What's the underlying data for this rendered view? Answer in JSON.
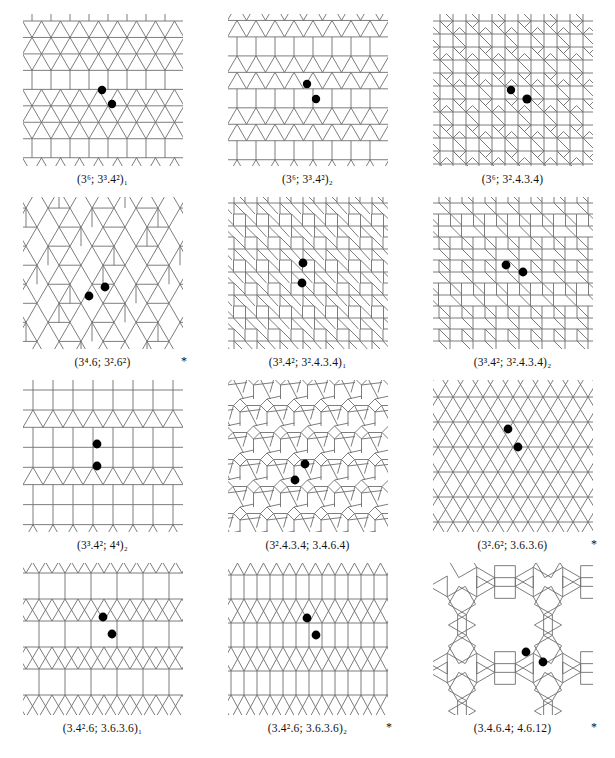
{
  "figure": {
    "kind": "two-uniform-tilings-plate",
    "columns": 3,
    "rows": 4,
    "edge_color": "#6e6e6e",
    "vertex_dot_color": "#000000",
    "background_color": "#ffffff",
    "marked_vertices_per_panel": 2,
    "star_symbol": "*"
  },
  "panels": [
    {
      "index": 1,
      "caption": "(3⁶; 3³.4²)₁",
      "caption_parts": {
        "first": "3",
        "first_sup": "6",
        "second": "3",
        "second_sup": "3",
        "third": "4",
        "third_sup": "2",
        "subscript": "1"
      },
      "starred": false,
      "star": "",
      "tiling_type": "triangle-square-bands",
      "vertex_types": [
        "3.3.3.3.3.3",
        "3.3.3.4.4"
      ]
    },
    {
      "index": 2,
      "caption": "(3⁶; 3³.4²)₂",
      "caption_parts": {
        "first": "3",
        "first_sup": "6",
        "second": "3",
        "second_sup": "3",
        "third": "4",
        "third_sup": "2",
        "subscript": "2"
      },
      "starred": false,
      "star": "",
      "tiling_type": "double-triangle-square-bands",
      "vertex_types": [
        "3.3.3.3.3.3",
        "3.3.3.4.4"
      ]
    },
    {
      "index": 3,
      "caption": "(3⁶; 3².4.3.4)",
      "caption_parts": {
        "first": "3",
        "first_sup": "6",
        "second": "3",
        "second_sup": "2",
        "third": "4.3.4",
        "third_sup": "",
        "subscript": ""
      },
      "starred": false,
      "star": "",
      "tiling_type": "triangle-square-rosette",
      "vertex_types": [
        "3.3.3.3.3.3",
        "3.3.4.3.4"
      ]
    },
    {
      "index": 4,
      "caption": "(3⁴.6; 3².6²)",
      "caption_parts": {
        "first": "3",
        "first_sup": "4",
        "first_tail": ".6",
        "second": "3",
        "second_sup": "2",
        "third": "6",
        "third_sup": "2",
        "subscript": ""
      },
      "starred": true,
      "star": "*",
      "tiling_type": "triangle-hexagon-lattice",
      "vertex_types": [
        "3.3.3.3.6",
        "3.3.6.6"
      ]
    },
    {
      "index": 5,
      "caption": "(3³.4²; 3².4.3.4)₁",
      "caption_parts": {
        "first": "3",
        "first_sup": "3",
        "first_tail": ".4",
        "first_sup2": "2",
        "second": "3",
        "second_sup": "2",
        "third": "4.3.4",
        "subscript": "1"
      },
      "starred": false,
      "star": "",
      "tiling_type": "square-triangle-mixed-a",
      "vertex_types": [
        "3.3.3.4.4",
        "3.3.4.3.4"
      ]
    },
    {
      "index": 6,
      "caption": "(3³.4²; 3².4.3.4)₂",
      "caption_parts": {
        "first": "3",
        "first_sup": "3",
        "first_tail": ".4",
        "first_sup2": "2",
        "second": "3",
        "second_sup": "2",
        "third": "4.3.4",
        "subscript": "2"
      },
      "starred": false,
      "star": "",
      "tiling_type": "square-triangle-mixed-b",
      "vertex_types": [
        "3.3.3.4.4",
        "3.3.4.3.4"
      ]
    },
    {
      "index": 7,
      "caption": "(3³.4²; 4⁴)₂",
      "caption_parts": {
        "first": "3",
        "first_sup": "3",
        "first_tail": ".4",
        "first_sup2": "2",
        "second": "4",
        "second_sup": "4",
        "subscript": "2"
      },
      "starred": false,
      "star": "",
      "tiling_type": "square-grid-triangle-bands",
      "vertex_types": [
        "3.3.3.4.4",
        "4.4.4.4"
      ]
    },
    {
      "index": 8,
      "caption": "(3².4.3.4; 3.4.6.4)",
      "caption_parts": {
        "first": "3",
        "first_sup": "2",
        "first_tail": ".4.3.4",
        "second": "3.4.6.4",
        "subscript": ""
      },
      "starred": false,
      "star": "",
      "tiling_type": "triangle-square-hexagon-mixed",
      "vertex_types": [
        "3.3.4.3.4",
        "3.4.6.4"
      ]
    },
    {
      "index": 9,
      "caption": "(3².6²; 3.6.3.6)",
      "caption_parts": {
        "first": "3",
        "first_sup": "2",
        "first_tail": ".6",
        "first_sup2": "2",
        "second": "3.6.3.6",
        "subscript": ""
      },
      "starred": true,
      "star": "*",
      "tiling_type": "hexagon-triangle-columns",
      "vertex_types": [
        "3.3.6.6",
        "3.6.3.6"
      ]
    },
    {
      "index": 10,
      "caption": "(3.4².6; 3.6.3.6)₁",
      "caption_parts": {
        "first": "3.4",
        "first_sup": "2",
        "first_tail": ".6",
        "second": "3.6.3.6",
        "subscript": "1"
      },
      "starred": false,
      "star": "",
      "tiling_type": "square-rows-x-rows-a",
      "vertex_types": [
        "3.4.4.6",
        "3.6.3.6"
      ]
    },
    {
      "index": 11,
      "caption": "(3.4².6; 3.6.3.6)₂",
      "caption_parts": {
        "first": "3.4",
        "first_sup": "2",
        "first_tail": ".6",
        "second": "3.6.3.6",
        "subscript": "2"
      },
      "starred": true,
      "star": "*",
      "tiling_type": "square-rows-x-rows-b",
      "vertex_types": [
        "3.4.4.6",
        "3.6.3.6"
      ]
    },
    {
      "index": 12,
      "caption": "(3.4.6.4; 4.6.12)",
      "caption_parts": {
        "first": "3.4.6.4",
        "second": "4.6.12",
        "subscript": ""
      },
      "starred": true,
      "star": "*",
      "tiling_type": "dodecagon-square-triangle",
      "vertex_types": [
        "3.4.6.4",
        "4.6.12"
      ]
    }
  ]
}
